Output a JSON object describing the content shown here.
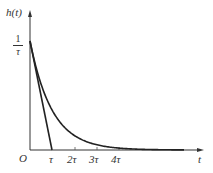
{
  "chart_data": {
    "type": "line",
    "title": "",
    "xlabel": "t",
    "ylabel": "h(t)",
    "x_tick_labels": [
      "τ",
      "2τ",
      "3τ",
      "4τ"
    ],
    "y_tick_labels": [
      "1/τ"
    ],
    "origin_label": "O",
    "series": [
      {
        "name": "h(t) = (1/τ)e^(-t/τ)",
        "x": [
          0,
          0.5,
          1,
          1.5,
          2,
          2.5,
          3,
          3.5,
          4,
          5,
          6
        ],
        "values": [
          1.0,
          0.607,
          0.368,
          0.223,
          0.135,
          0.082,
          0.05,
          0.03,
          0.018,
          0.007,
          0.002
        ]
      },
      {
        "name": "tangent at t=0",
        "x": [
          0,
          1
        ],
        "values": [
          1.0,
          0.0
        ]
      }
    ],
    "x_units": "τ",
    "y_units": "1/τ",
    "xlim": [
      0,
      7.8
    ],
    "ylim": [
      0,
      1.25
    ],
    "grid": false,
    "legend": "none"
  },
  "labels": {
    "y_axis": "h(t)",
    "x_axis": "t",
    "origin": "O",
    "y_tick_num": "1",
    "y_tick_den": "τ",
    "x_ticks": [
      "τ",
      "2τ",
      "3τ",
      "4τ"
    ]
  }
}
